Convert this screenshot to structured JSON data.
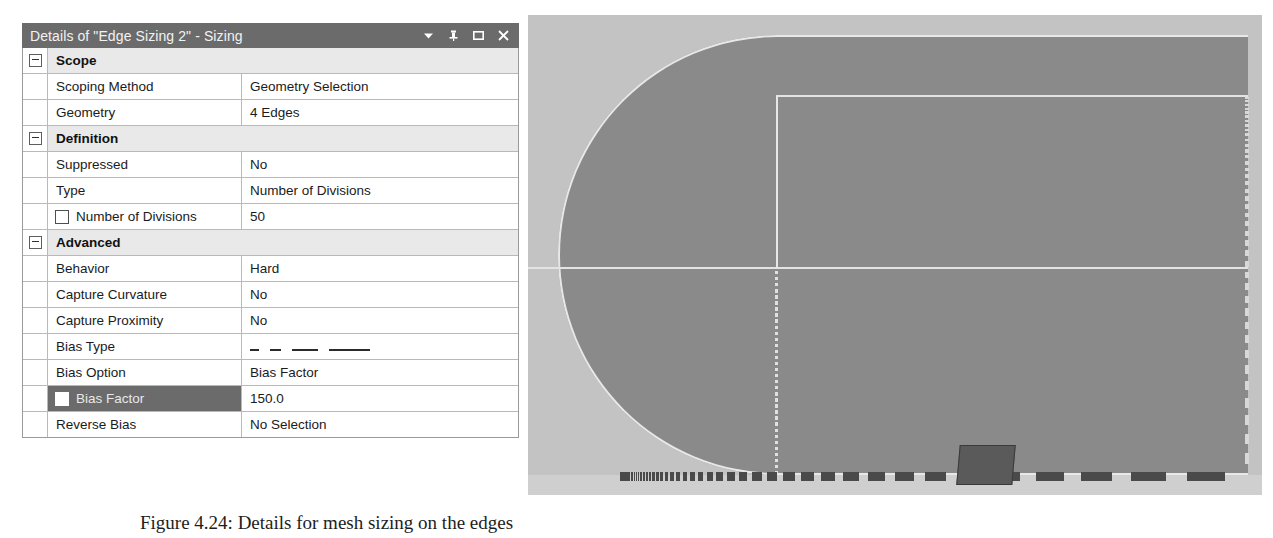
{
  "panel": {
    "title": "Details of \"Edge Sizing 2\" - Sizing",
    "icons": {
      "dropdown": "chevron-down-icon",
      "pin": "pin-icon",
      "maximize": "maximize-icon",
      "close": "close-icon"
    },
    "rows": [
      {
        "kind": "section",
        "label": "Scope"
      },
      {
        "kind": "prop",
        "label": "Scoping Method",
        "value": "Geometry Selection"
      },
      {
        "kind": "prop",
        "label": "Geometry",
        "value": "4 Edges"
      },
      {
        "kind": "section",
        "label": "Definition"
      },
      {
        "kind": "prop",
        "label": "Suppressed",
        "value": "No"
      },
      {
        "kind": "prop",
        "label": "Type",
        "value": "Number of Divisions"
      },
      {
        "kind": "prop",
        "label": "Number of Divisions",
        "value": "50",
        "checkbox": true
      },
      {
        "kind": "section",
        "label": "Advanced"
      },
      {
        "kind": "prop",
        "label": "Behavior",
        "value": "Hard"
      },
      {
        "kind": "prop",
        "label": "Capture Curvature",
        "value": "No"
      },
      {
        "kind": "prop",
        "label": "Capture Proximity",
        "value": "No"
      },
      {
        "kind": "prop",
        "label": "Bias Type",
        "value": "",
        "graphic": "bias-dashes"
      },
      {
        "kind": "prop",
        "label": "Bias Option",
        "value": "Bias Factor"
      },
      {
        "kind": "prop",
        "label": "Bias Factor",
        "value": "150.0",
        "checkbox": true,
        "selected": true
      },
      {
        "kind": "prop",
        "label": "Reverse Bias",
        "value": "No Selection"
      }
    ]
  },
  "viewport": {
    "name": "geometry-mesh-preview",
    "colors": {
      "background": "#c3c3c3",
      "body_fill": "#8a8a8a",
      "edge_line": "#e6e6e6",
      "mesh_dash": "#4a4a4a",
      "selection_marker": "#5a5a5a"
    },
    "bottom_edge_divisions": 50,
    "bias_factor": "150.0"
  },
  "caption": {
    "text": "Figure 4.24: Details for mesh sizing on the edges"
  }
}
